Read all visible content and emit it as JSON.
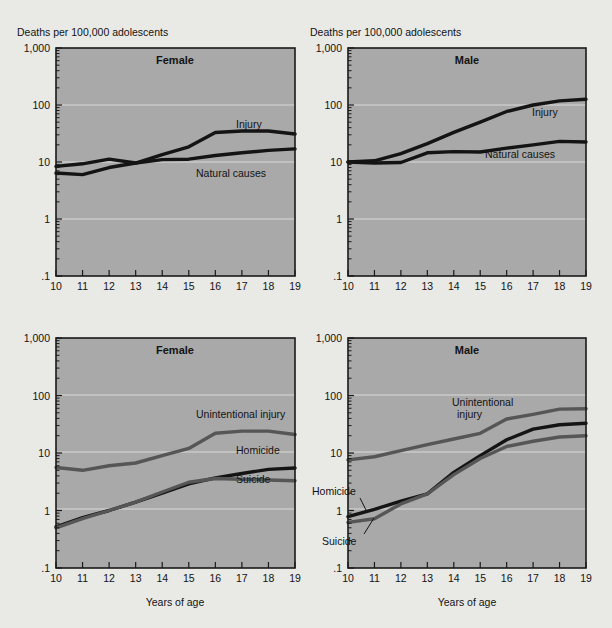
{
  "figure": {
    "axis_note": "Deaths per 100,000 adolescents",
    "x_axis_title": "Years of age",
    "y_tick_labels": [
      "1,000",
      "100",
      "10",
      "1",
      ".1"
    ],
    "x_tick_labels": [
      "10",
      "11",
      "12",
      "13",
      "14",
      "15",
      "16",
      "17",
      "18",
      "19"
    ],
    "colors": {
      "plot_background": "#a9a9a9",
      "page_background": "#e9e9e6",
      "gridline": "#d9d9d6",
      "dark_series": "#141414",
      "gray_series": "#565656",
      "axis": "#1a1a1a"
    }
  },
  "chart_data": [
    {
      "id": "top-left",
      "type": "line",
      "title": "Female",
      "xlabel": "Years of age",
      "ylabel": "Deaths per 100,000 adolescents",
      "x": [
        10,
        11,
        12,
        13,
        14,
        15,
        16,
        17,
        18,
        19
      ],
      "xlim": [
        10,
        19
      ],
      "ylim": [
        0.1,
        1000
      ],
      "yscale": "log",
      "grid": true,
      "legend_position": "inline-right",
      "series": [
        {
          "name": "Injury",
          "color": "#141414",
          "values": [
            6.4,
            6.0,
            8.0,
            9.6,
            13.5,
            18.5,
            33.0,
            35.0,
            35.0,
            31.0
          ]
        },
        {
          "name": "Natural causes",
          "color": "#141414",
          "values": [
            8.4,
            9.3,
            11.2,
            9.6,
            11.0,
            11.2,
            13.0,
            14.5,
            16.0,
            17.0
          ]
        }
      ]
    },
    {
      "id": "top-right",
      "type": "line",
      "title": "Male",
      "xlabel": "Years of age",
      "ylabel": "Deaths per 100,000 adolescents",
      "x": [
        10,
        11,
        12,
        13,
        14,
        15,
        16,
        17,
        18,
        19
      ],
      "xlim": [
        10,
        19
      ],
      "ylim": [
        0.1,
        1000
      ],
      "yscale": "log",
      "grid": true,
      "legend_position": "inline-right",
      "series": [
        {
          "name": "Injury",
          "color": "#141414",
          "values": [
            10.0,
            10.5,
            14.0,
            21.0,
            33.0,
            50.0,
            77.0,
            100.0,
            118.0,
            126.0
          ]
        },
        {
          "name": "Natural causes",
          "color": "#141414",
          "values": [
            10.0,
            9.6,
            9.8,
            14.5,
            15.2,
            15.0,
            17.5,
            20.0,
            23.0,
            22.5
          ]
        }
      ]
    },
    {
      "id": "bottom-left",
      "type": "line",
      "title": "Female",
      "xlabel": "Years of age",
      "ylabel": "Deaths per 100,000 adolescents",
      "x": [
        10,
        11,
        12,
        13,
        14,
        15,
        16,
        17,
        18,
        19
      ],
      "xlim": [
        10,
        19
      ],
      "ylim": [
        0.1,
        1000
      ],
      "yscale": "log",
      "grid": true,
      "legend_position": "inline-right",
      "series": [
        {
          "name": "Unintentional injury",
          "color": "#565656",
          "values": [
            5.6,
            5.0,
            6.0,
            6.7,
            9.0,
            12.0,
            22.0,
            24.0,
            24.0,
            21.0
          ]
        },
        {
          "name": "Homicide",
          "color": "#141414",
          "values": [
            0.52,
            0.75,
            1.0,
            1.4,
            2.0,
            2.9,
            3.7,
            4.4,
            5.2,
            5.5
          ]
        },
        {
          "name": "Suicide",
          "color": "#565656",
          "values": [
            0.5,
            0.72,
            1.0,
            1.4,
            2.1,
            3.1,
            3.6,
            3.5,
            3.4,
            3.3
          ]
        }
      ]
    },
    {
      "id": "bottom-right",
      "type": "line",
      "title": "Male",
      "xlabel": "Years of age",
      "ylabel": "Deaths per 100,000 adolescents",
      "x": [
        10,
        11,
        12,
        13,
        14,
        15,
        16,
        17,
        18,
        19
      ],
      "xlim": [
        10,
        19
      ],
      "ylim": [
        0.1,
        1000
      ],
      "yscale": "log",
      "grid": true,
      "legend_position": "inline-right",
      "series": [
        {
          "name": "Unintentional injury",
          "color": "#565656",
          "values": [
            7.6,
            8.6,
            11.0,
            14.0,
            17.5,
            22.0,
            39.0,
            47.0,
            58.0,
            59.0
          ]
        },
        {
          "name": "Homicide",
          "color": "#141414",
          "values": [
            0.78,
            1.05,
            1.45,
            1.95,
            4.6,
            9.0,
            17.0,
            26.0,
            31.0,
            33.0
          ]
        },
        {
          "name": "Suicide",
          "color": "#565656",
          "values": [
            0.62,
            0.72,
            1.3,
            1.95,
            4.2,
            8.0,
            13.0,
            16.0,
            19.0,
            20.0
          ]
        }
      ]
    }
  ],
  "panels": {
    "top_left": {
      "title": "Female",
      "axis_note": "Deaths per 100,000 adolescents",
      "labels": {
        "injury": "Injury",
        "natural": "Natural causes"
      }
    },
    "top_right": {
      "title": "Male",
      "axis_note": "Deaths per 100,000 adolescents",
      "labels": {
        "injury": "Injury",
        "natural": "Natural causes"
      }
    },
    "bottom_left": {
      "title": "Female",
      "x_axis_title": "Years of age",
      "labels": {
        "unintentional": "Unintentional injury",
        "homicide": "Homicide",
        "suicide": "Suicide"
      }
    },
    "bottom_right": {
      "title": "Male",
      "x_axis_title": "Years of age",
      "labels": {
        "unintentional_l1": "Unintentional",
        "unintentional_l2": "injury",
        "homicide": "Homicide",
        "suicide": "Suicide"
      }
    }
  }
}
